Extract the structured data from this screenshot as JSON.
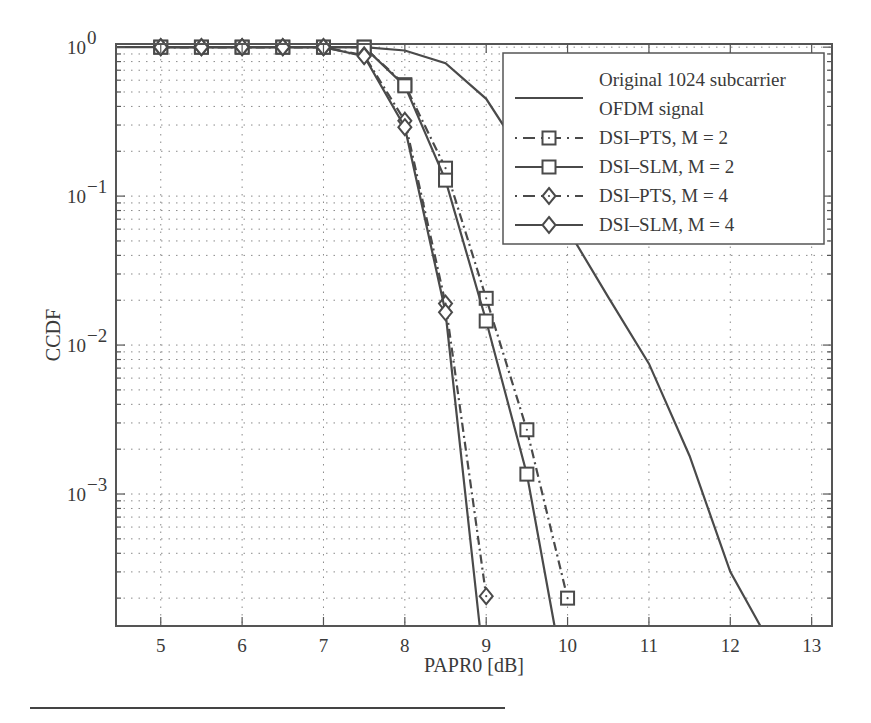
{
  "chart_data": {
    "type": "line",
    "title": "",
    "xlabel": "PAPR0 [dB]",
    "ylabel": "CCDF",
    "xscale": "linear",
    "yscale": "log",
    "xlim": [
      4.45,
      13.25
    ],
    "ylim": [
      0.00013,
      1.05
    ],
    "xticks": [
      5,
      6,
      7,
      8,
      9,
      10,
      11,
      12,
      13
    ],
    "xtick_labels": [
      "5",
      "6",
      "7",
      "8",
      "9",
      "10",
      "11",
      "12",
      "13"
    ],
    "yticks": [
      1,
      0.1,
      0.01,
      0.001
    ],
    "ytick_labels": [
      {
        "base": "10",
        "exp": "0"
      },
      {
        "base": "10",
        "exp": "−1"
      },
      {
        "base": "10",
        "exp": "−2"
      },
      {
        "base": "10",
        "exp": "−3"
      }
    ],
    "grid": true,
    "legend_position": "upper right",
    "series": [
      {
        "name": "Original 1024 subcarrier OFDM signal",
        "legend_lines": [
          "Original 1024 subcarrier",
          "OFDM signal"
        ],
        "line": "solid",
        "marker": "none",
        "x": [
          4.45,
          7.5,
          8.0,
          8.5,
          9.0,
          9.5,
          10.0,
          10.5,
          11.0,
          11.5,
          12.0,
          12.37
        ],
        "y": [
          1.0,
          1.0,
          0.95,
          0.78,
          0.45,
          0.17,
          0.06,
          0.021,
          0.0075,
          0.0018,
          0.0003,
          0.00013
        ]
      },
      {
        "name": "DSI–PTS, M = 2",
        "line": "dashdot",
        "marker": "square-dot",
        "x": [
          5,
          5.5,
          6,
          6.5,
          7,
          7.5,
          8,
          8.5,
          9,
          9.5,
          10
        ],
        "y": [
          1.0,
          1.0,
          1.0,
          1.0,
          1.0,
          1.0,
          0.56,
          0.154,
          0.0206,
          0.0027,
          0.0002
        ]
      },
      {
        "name": "DSI–SLM, M = 2",
        "line": "solid",
        "marker": "square",
        "x": [
          5,
          5.5,
          6,
          6.5,
          7,
          7.5,
          8,
          8.5,
          9,
          9.5,
          9.84
        ],
        "y": [
          1.0,
          1.0,
          1.0,
          1.0,
          1.0,
          1.0,
          0.55,
          0.128,
          0.0145,
          0.00136,
          0.00013
        ],
        "marker_count": 10
      },
      {
        "name": "DSI–PTS, M = 4",
        "line": "dashdot",
        "marker": "diamond-dot",
        "x": [
          5,
          5.5,
          6,
          6.5,
          7,
          7.5,
          8,
          8.5,
          9
        ],
        "y": [
          1.0,
          1.0,
          1.0,
          1.0,
          1.0,
          0.88,
          0.32,
          0.019,
          0.000206
        ]
      },
      {
        "name": "DSI–SLM, M = 4",
        "line": "solid",
        "marker": "diamond",
        "x": [
          5,
          5.5,
          6,
          6.5,
          7,
          7.5,
          8,
          8.5,
          8.92
        ],
        "y": [
          1.0,
          1.0,
          1.0,
          1.0,
          1.0,
          0.87,
          0.29,
          0.0166,
          0.00013
        ],
        "marker_count": 8
      }
    ]
  },
  "colors": {
    "line": "#4a4a4a",
    "grid": "#8a8a8a",
    "axis": "#555555",
    "text": "#3a3a3a"
  }
}
